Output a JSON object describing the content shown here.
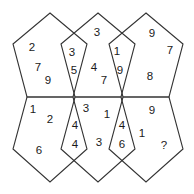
{
  "colors": {
    "line": "#333333",
    "text": "#1a1a1a",
    "background": "#ffffff"
  },
  "pentagons": {
    "top_left": {
      "points": "50,13 87,44 73,97 27,97 13,44"
    },
    "top_middle": {
      "points": "98,13 135,44 121,97 75,97 61,44"
    },
    "top_right": {
      "points": "146,13 183,44 169,97 123,97 109,44"
    },
    "bottom_left": {
      "points": "27,97 73,97 87,149 50,182 13,149"
    },
    "bottom_middle": {
      "points": "75,97 121,97 135,149 98,182 61,149"
    },
    "bottom_right": {
      "points": "123,97 169,97 183,149 146,182 109,149"
    }
  },
  "numbers": [
    {
      "id": "tl-1",
      "label": "2",
      "x": 32,
      "y": 47
    },
    {
      "id": "tl-2",
      "label": "7",
      "x": 38,
      "y": 67
    },
    {
      "id": "tl-3",
      "label": "9",
      "x": 48,
      "y": 80
    },
    {
      "id": "tl-kite-1",
      "label": "3",
      "x": 72,
      "y": 52
    },
    {
      "id": "tl-kite-2",
      "label": "5",
      "x": 74,
      "y": 70
    },
    {
      "id": "tm-1",
      "label": "3",
      "x": 97,
      "y": 32
    },
    {
      "id": "tm-2",
      "label": "4",
      "x": 94,
      "y": 67
    },
    {
      "id": "tm-3",
      "label": "7",
      "x": 104,
      "y": 80
    },
    {
      "id": "tr-kite-1",
      "label": "1",
      "x": 117,
      "y": 51
    },
    {
      "id": "tr-kite-2",
      "label": "9",
      "x": 120,
      "y": 70
    },
    {
      "id": "tr-1",
      "label": "9",
      "x": 152,
      "y": 33
    },
    {
      "id": "tr-2",
      "label": "7",
      "x": 170,
      "y": 50
    },
    {
      "id": "tr-3",
      "label": "8",
      "x": 150,
      "y": 76
    },
    {
      "id": "bl-1",
      "label": "1",
      "x": 33,
      "y": 109
    },
    {
      "id": "bl-2",
      "label": "2",
      "x": 50,
      "y": 119
    },
    {
      "id": "bl-3",
      "label": "6",
      "x": 39,
      "y": 150
    },
    {
      "id": "bl-kite-1",
      "label": "4",
      "x": 75,
      "y": 125
    },
    {
      "id": "bl-kite-2",
      "label": "4",
      "x": 75,
      "y": 144
    },
    {
      "id": "bm-1",
      "label": "3",
      "x": 86,
      "y": 108
    },
    {
      "id": "bm-2",
      "label": "1",
      "x": 107,
      "y": 114
    },
    {
      "id": "bm-3",
      "label": "3",
      "x": 99,
      "y": 142
    },
    {
      "id": "br-kite-1",
      "label": "4",
      "x": 122,
      "y": 125
    },
    {
      "id": "br-kite-2",
      "label": "6",
      "x": 122,
      "y": 144
    },
    {
      "id": "br-1",
      "label": "9",
      "x": 152,
      "y": 110
    },
    {
      "id": "br-2",
      "label": "1",
      "x": 142,
      "y": 133
    },
    {
      "id": "br-3",
      "label": "?",
      "x": 164,
      "y": 145
    }
  ]
}
